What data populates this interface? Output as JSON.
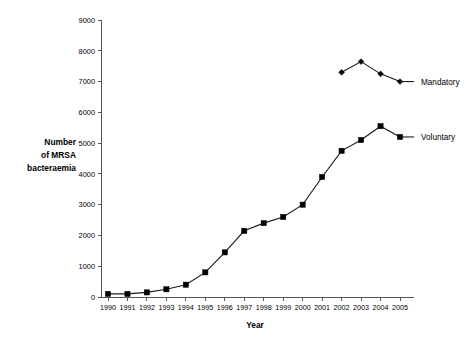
{
  "chart_data": {
    "type": "line",
    "title": "",
    "xlabel": "Year",
    "ylabel": "Number of MRSA bacteraemia",
    "ylabel_lines": [
      "Number",
      "of MRSA",
      "bacteraemia"
    ],
    "x": [
      1990,
      1991,
      1992,
      1993,
      1994,
      1995,
      1996,
      1997,
      1998,
      1999,
      2000,
      2001,
      2002,
      2003,
      2004,
      2005
    ],
    "xtick_labels": [
      "1990",
      "1991",
      "1992",
      "1993",
      "1994",
      "1995",
      "1996",
      "1997",
      "1998",
      "1999",
      "2000",
      "2001",
      "2002",
      "2003",
      "2004",
      "2005"
    ],
    "ytick_labels": [
      "0",
      "1000",
      "2000",
      "3000",
      "4000",
      "5000",
      "6000",
      "7000",
      "8000",
      "9000"
    ],
    "ytick_values": [
      0,
      1000,
      2000,
      3000,
      4000,
      5000,
      6000,
      7000,
      8000,
      9000
    ],
    "ylim": [
      0,
      9000
    ],
    "xlim": [
      1990,
      2005
    ],
    "grid": false,
    "legend_position": "right-inline",
    "series": [
      {
        "name": "Mandatory",
        "marker": "diamond",
        "x": [
          2002,
          2003,
          2004,
          2005
        ],
        "values": [
          7300,
          7650,
          7250,
          7000
        ]
      },
      {
        "name": "Voluntary",
        "marker": "square",
        "x": [
          1990,
          1991,
          1992,
          1993,
          1994,
          1995,
          1996,
          1997,
          1998,
          1999,
          2000,
          2001,
          2002,
          2003,
          2004,
          2005
        ],
        "values": [
          100,
          100,
          150,
          250,
          400,
          800,
          1450,
          2150,
          2400,
          2600,
          3000,
          3900,
          4750,
          5100,
          5550,
          5200
        ]
      }
    ],
    "colors": {
      "line": "#1a1a1a",
      "marker": "#000000",
      "axis": "#555555",
      "background": "#ffffff"
    }
  }
}
